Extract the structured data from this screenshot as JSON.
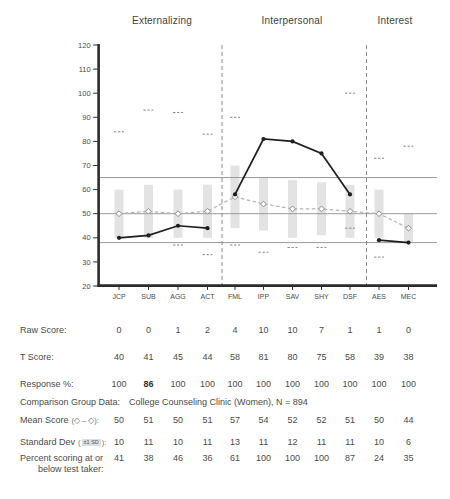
{
  "headers": {
    "externalizing": "Externalizing",
    "interpersonal": "Interpersonal",
    "interest": "Interest"
  },
  "chart_data": {
    "type": "line",
    "categories": [
      "JCP",
      "SUB",
      "AGG",
      "ACT",
      "FML",
      "IPP",
      "SAV",
      "SHY",
      "DSF",
      "AES",
      "MEC"
    ],
    "sections": [
      {
        "label": "Externalizing",
        "indices": [
          0,
          3
        ]
      },
      {
        "label": "Interpersonal",
        "indices": [
          4,
          8
        ]
      },
      {
        "label": "Interest",
        "indices": [
          9,
          10
        ]
      }
    ],
    "series": [
      {
        "name": "T Score",
        "values": [
          40,
          41,
          45,
          44,
          58,
          81,
          80,
          75,
          58,
          39,
          38
        ]
      },
      {
        "name": "Comparison Group Mean",
        "values": [
          50,
          51,
          50,
          51,
          57,
          54,
          52,
          52,
          51,
          50,
          44
        ]
      }
    ],
    "std_dev": [
      10,
      11,
      10,
      11,
      13,
      11,
      12,
      11,
      11,
      10,
      6
    ],
    "max_possible_marks": [
      84,
      93,
      92,
      83,
      90,
      null,
      null,
      null,
      100,
      73,
      78
    ],
    "min_possible_marks": [
      null,
      null,
      37,
      33,
      37,
      34,
      36,
      36,
      44,
      32,
      null
    ],
    "ylim": [
      20,
      120
    ],
    "ytick_step": 10,
    "reference_lines": [
      65,
      50,
      38
    ],
    "legend_position": "below-table",
    "grid": false,
    "colors": {
      "axis": "#2b2b2b",
      "text": "#4a4a4a",
      "ref_line": "#9a9a9a",
      "divider": "#8a8a8a",
      "sd_bar": "#e3e3e3",
      "mean_line": "#b3b3b3",
      "mean_marker": "#8f8f8f",
      "mark": "#7a7a7a",
      "profile_line": "#1f1f1f"
    }
  },
  "table": {
    "comparison": {
      "label": "Comparison Group Data:",
      "value": "College Counseling Clinic (Women), N = 894"
    },
    "rows": [
      {
        "id": "raw",
        "label": "Raw Score:",
        "values": [
          "0",
          "0",
          "1",
          "2",
          "4",
          "10",
          "10",
          "7",
          "1",
          "1",
          "0"
        ]
      },
      {
        "id": "t",
        "label": "T Score:",
        "values": [
          "40",
          "41",
          "45",
          "44",
          "58",
          "81",
          "80",
          "75",
          "58",
          "39",
          "38"
        ]
      },
      {
        "id": "resp",
        "label": "Response %:",
        "values": [
          "100",
          "86",
          "100",
          "100",
          "100",
          "100",
          "100",
          "100",
          "100",
          "100",
          "100"
        ],
        "bold": [
          1
        ]
      },
      {
        "id": "mean",
        "label": "Mean Score",
        "legend": "(◇ – ◇):",
        "values": [
          "50",
          "51",
          "50",
          "51",
          "57",
          "54",
          "52",
          "52",
          "51",
          "50",
          "44"
        ]
      },
      {
        "id": "sd",
        "label": "Standard Dev",
        "legend_pre": "(",
        "legend_chip": "±1 SD",
        "legend_post": "):",
        "values": [
          "10",
          "11",
          "10",
          "11",
          "13",
          "11",
          "12",
          "11",
          "11",
          "10",
          "6"
        ]
      },
      {
        "id": "pct",
        "label": "Percent scoring at or",
        "label2": "below test taker:",
        "values": [
          "41",
          "38",
          "46",
          "36",
          "61",
          "100",
          "100",
          "100",
          "87",
          "24",
          "35"
        ]
      }
    ]
  }
}
